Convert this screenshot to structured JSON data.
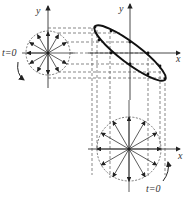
{
  "figure": {
    "left_circle": {
      "axis_label_y": "y",
      "start_label": "t=0",
      "center": [
        48,
        53
      ],
      "radius": 22
    },
    "ellipse_plot": {
      "axis_label_x": "x",
      "axis_label_y": "y",
      "origin": [
        130,
        53
      ],
      "vertex_upper_left": [
        95,
        26
      ],
      "vertex_lower_right": [
        164,
        79
      ]
    },
    "bottom_circle": {
      "axis_label_x": "x",
      "start_label": "t=0",
      "center": [
        129,
        149
      ],
      "radius": 32
    },
    "colors": {
      "line": "#333333",
      "dashed": "#555555",
      "background": "#ffffff"
    }
  }
}
